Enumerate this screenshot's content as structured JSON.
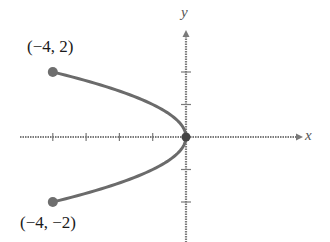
{
  "chart_data": {
    "type": "line",
    "title": "",
    "equation": "x = -y^2",
    "xlabel": "x",
    "ylabel": "y",
    "xlim": [
      -5,
      3.5
    ],
    "ylim": [
      -3,
      3.3
    ],
    "grid": false,
    "x_ticks": [
      -4,
      -3,
      -2,
      -1
    ],
    "y_ticks": [
      -2,
      -1,
      1,
      2
    ],
    "series": [
      {
        "name": "curve",
        "points": [
          [
            -4,
            2
          ],
          [
            -2.25,
            1.5
          ],
          [
            -1,
            1
          ],
          [
            -0.25,
            0.5
          ],
          [
            0,
            0
          ],
          [
            -0.25,
            -0.5
          ],
          [
            -1,
            -1
          ],
          [
            -2.25,
            -1.5
          ],
          [
            -4,
            -2
          ]
        ]
      }
    ],
    "endpoints": [
      {
        "x": -4,
        "y": 2,
        "label": "(−4, 2)"
      },
      {
        "x": -4,
        "y": -2,
        "label": "(−4, −2)"
      }
    ],
    "origin_point": {
      "x": 0,
      "y": 0
    },
    "colors": {
      "curve": "#6b6b6b",
      "axis": "#7a7a7a",
      "point": "#6e6e6e",
      "text": "#1a1a1a"
    }
  },
  "labels": {
    "x_axis": "x",
    "y_axis": "y",
    "top_point": "(−4, 2)",
    "bottom_point": "(−4, −2)"
  }
}
